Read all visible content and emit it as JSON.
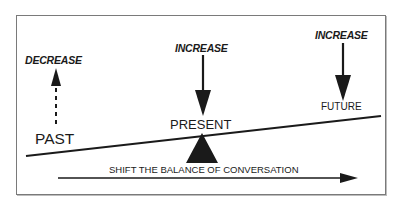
{
  "diagram": {
    "type": "seesaw-balance",
    "colors": {
      "ink": "#1a1a1a",
      "frame": "#7a7a7a",
      "background": "#ffffff"
    },
    "labels": {
      "past": "PAST",
      "present": "PRESENT",
      "future": "FUTURE",
      "past_direction": "DECREASE",
      "present_direction": "INCREASE",
      "future_direction": "INCREASE",
      "bottom_caption": "SHIFT THE BALANCE OF CONVERSATION"
    },
    "arrows": [
      {
        "name": "past-arrow",
        "direction": "up",
        "style": "dashed",
        "label": "DECREASE"
      },
      {
        "name": "present-arrow",
        "direction": "down",
        "style": "solid",
        "label": "INCREASE"
      },
      {
        "name": "future-arrow",
        "direction": "down",
        "style": "solid",
        "label": "INCREASE"
      },
      {
        "name": "shift-arrow",
        "direction": "right",
        "style": "solid",
        "label": "SHIFT THE BALANCE OF CONVERSATION"
      }
    ],
    "seesaw": {
      "tilt": "low on left (past), high on right (future)",
      "fulcrum": "under PRESENT"
    }
  }
}
